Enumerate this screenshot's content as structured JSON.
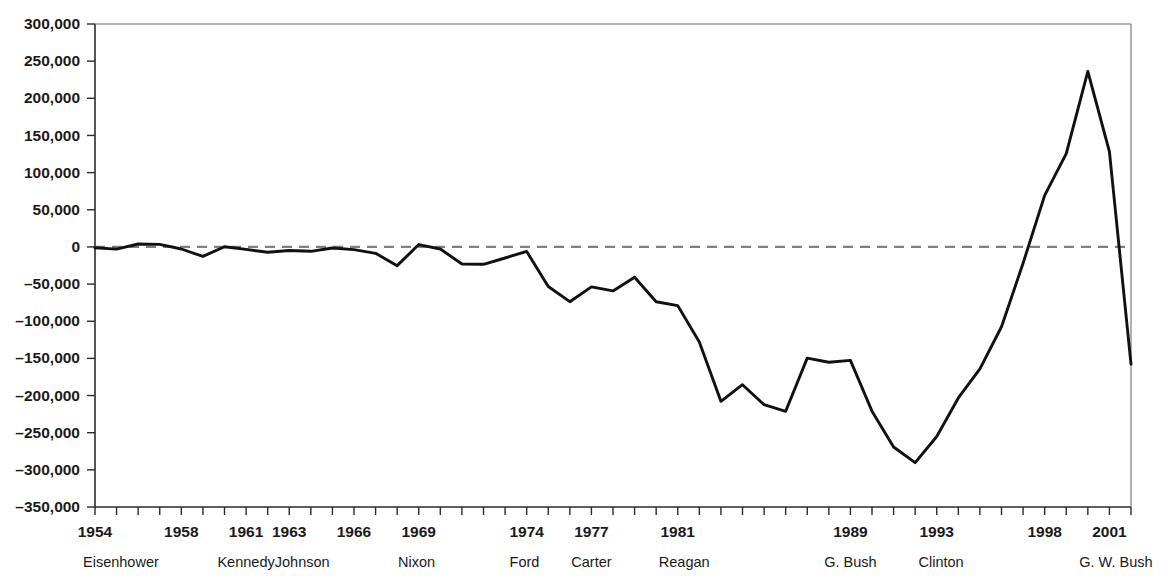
{
  "chart_data": {
    "type": "line",
    "title": "",
    "xlabel": "",
    "ylabel": "",
    "ylim": [
      -350000,
      300000
    ],
    "xlim": [
      1954,
      2002
    ],
    "grid": false,
    "legend": "none",
    "zero_reference_line": true,
    "y_ticks": [
      300000,
      250000,
      200000,
      150000,
      100000,
      50000,
      0,
      -50000,
      -100000,
      -150000,
      -200000,
      -250000,
      -300000,
      -350000
    ],
    "y_tick_labels": [
      "300,000",
      "250,000",
      "200,000",
      "150,000",
      "100,000",
      "50,000",
      "0",
      "–50,000",
      "–100,000",
      "–150,000",
      "–200,000",
      "–250,000",
      "–300,000",
      "–350,000"
    ],
    "x_tick_labels": [
      {
        "year": 1954,
        "label": "1954"
      },
      {
        "year": 1958,
        "label": "1958"
      },
      {
        "year": 1961,
        "label": "1961"
      },
      {
        "year": 1963,
        "label": "1963"
      },
      {
        "year": 1966,
        "label": "1966"
      },
      {
        "year": 1969,
        "label": "1969"
      },
      {
        "year": 1974,
        "label": "1974"
      },
      {
        "year": 1977,
        "label": "1977"
      },
      {
        "year": 1981,
        "label": "1981"
      },
      {
        "year": 1989,
        "label": "1989"
      },
      {
        "year": 1993,
        "label": "1993"
      },
      {
        "year": 1998,
        "label": "1998"
      },
      {
        "year": 2001,
        "label": "2001"
      }
    ],
    "administrations": [
      {
        "name": "Eisenhower",
        "year": 1955.2
      },
      {
        "name": "Kennedy",
        "year": 1961.0
      },
      {
        "name": "Johnson",
        "year": 1963.6
      },
      {
        "name": "Nixon",
        "year": 1968.9
      },
      {
        "name": "Ford",
        "year": 1973.9
      },
      {
        "name": "Carter",
        "year": 1977.0
      },
      {
        "name": "Reagan",
        "year": 1981.3
      },
      {
        "name": "G. Bush",
        "year": 1989.0
      },
      {
        "name": "Clinton",
        "year": 1993.2
      },
      {
        "name": "G. W. Bush",
        "year": 2001.3
      }
    ],
    "x": [
      1954,
      1955,
      1956,
      1957,
      1958,
      1959,
      1960,
      1961,
      1962,
      1963,
      1964,
      1965,
      1966,
      1967,
      1968,
      1969,
      1970,
      1971,
      1972,
      1973,
      1974,
      1975,
      1976,
      1977,
      1978,
      1979,
      1980,
      1981,
      1982,
      1983,
      1984,
      1985,
      1986,
      1987,
      1988,
      1989,
      1990,
      1991,
      1992,
      1993,
      1994,
      1995,
      1996,
      1997,
      1998,
      1999,
      2000,
      2001,
      2002
    ],
    "values": [
      -1200,
      -3000,
      3900,
      3400,
      -2800,
      -12800,
      300,
      -3300,
      -7100,
      -4800,
      -5900,
      -1400,
      -3700,
      -8600,
      -25200,
      3200,
      -2800,
      -23000,
      -23400,
      -14900,
      -6100,
      -53200,
      -73700,
      -53700,
      -59200,
      -40700,
      -73800,
      -79000,
      -128000,
      -207800,
      -185400,
      -212300,
      -221200,
      -149700,
      -155200,
      -152600,
      -221000,
      -269200,
      -290300,
      -255100,
      -203200,
      -164000,
      -107400,
      -21900,
      69300,
      125600,
      236200,
      128200,
      -157800
    ],
    "series_name": "Federal budget surplus or deficit (millions of dollars)",
    "line_color": "#111111",
    "zero_line_color": "#808080",
    "peak": {
      "year": 2000,
      "value": 236200
    },
    "trough": {
      "year": 1992,
      "value": -290300
    }
  }
}
